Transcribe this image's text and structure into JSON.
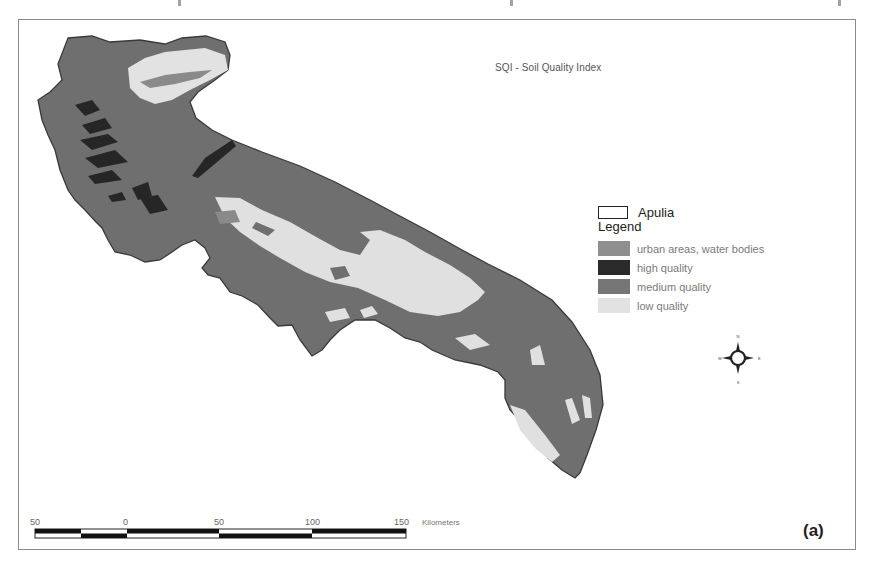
{
  "map": {
    "title": "SQI - Soil Quality Index",
    "region": "Apulia",
    "panel_label": "(a)"
  },
  "legend": {
    "outline_label": "Apulia",
    "title": "Legend",
    "items": [
      {
        "label": "urban areas, water bodies",
        "color": "#8f8f8f"
      },
      {
        "label": "high quality",
        "color": "#2a2a2a"
      },
      {
        "label": "medium quality",
        "color": "#767676"
      },
      {
        "label": "low quality",
        "color": "#e2e2e2"
      }
    ]
  },
  "colors": {
    "medium": "#6f6f6f",
    "low": "#e0e0e0",
    "high": "#262626",
    "urban": "#8f8f8f",
    "frame": "#8a8a8a"
  },
  "scale_bar": {
    "ticks": [
      "50",
      "0",
      "50",
      "100",
      "150"
    ],
    "units": "Kilometers"
  },
  "compass": {
    "n": "N",
    "s": "S",
    "e": "E",
    "w": "W"
  }
}
